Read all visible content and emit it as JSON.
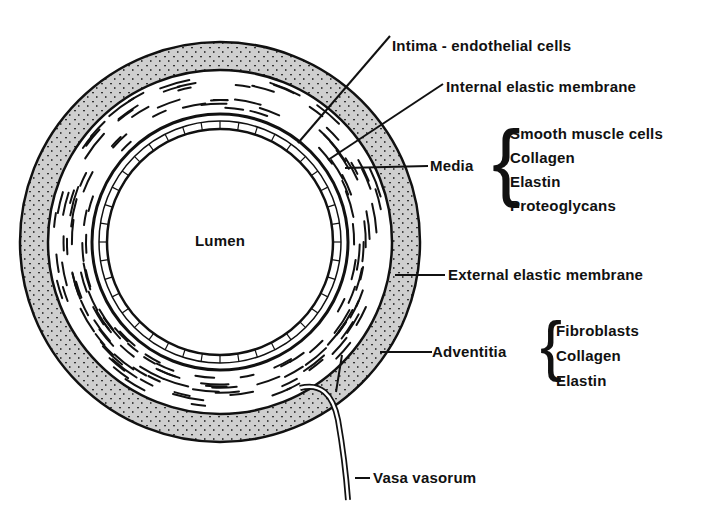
{
  "diagram": {
    "center_label": "Lumen",
    "labels": {
      "intima": "Intima - endothelial cells",
      "internal_elastic": "Internal elastic membrane",
      "media": "Media",
      "external_elastic": "External elastic membrane",
      "adventitia": "Adventitia",
      "vasa_vasorum": "Vasa vasorum"
    },
    "media_components": [
      "Smooth muscle cells",
      "Collagen",
      "Elastin",
      "Proteoglycans"
    ],
    "adventitia_components": [
      "Fibroblasts",
      "Collagen",
      "Elastin"
    ],
    "colors": {
      "ink": "#111111",
      "adventitia_fill": "#c8c8c8",
      "background": "#ffffff"
    }
  }
}
